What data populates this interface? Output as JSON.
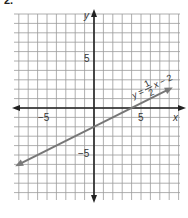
{
  "problem": {
    "number": "2."
  },
  "chart_data": {
    "type": "line",
    "title": "",
    "xlabel": "x",
    "ylabel": "y",
    "xlim": [
      -9,
      9
    ],
    "ylim": [
      -10,
      10
    ],
    "grid": true,
    "x_ticks_labeled": [
      -5,
      5
    ],
    "y_ticks_labeled": [
      5,
      -5
    ],
    "tick_labels": {
      "x_neg": "−5",
      "x_pos": "5",
      "y_pos": "5",
      "y_neg": "−5"
    },
    "series": [
      {
        "name": "y = 1/2 x − 2",
        "equation": "y = (1/2)x − 2",
        "slope": 0.5,
        "intercept": -2,
        "x": [
          -8,
          8
        ],
        "y": [
          -6,
          2
        ],
        "color": "#777777"
      }
    ],
    "annotations": [
      {
        "text": "y = 1/2 x − 2",
        "position": "above line near x=6"
      }
    ]
  },
  "labels": {
    "x_axis": "x",
    "y_axis": "y",
    "eq_y": "y",
    "eq_eq": "=",
    "eq_num": "1",
    "eq_den": "2",
    "eq_x": "x",
    "eq_rest": "− 2"
  },
  "colors": {
    "grid": "#9a9a9a",
    "axis": "#222222",
    "line": "#7a7a7a",
    "text": "#333333"
  }
}
